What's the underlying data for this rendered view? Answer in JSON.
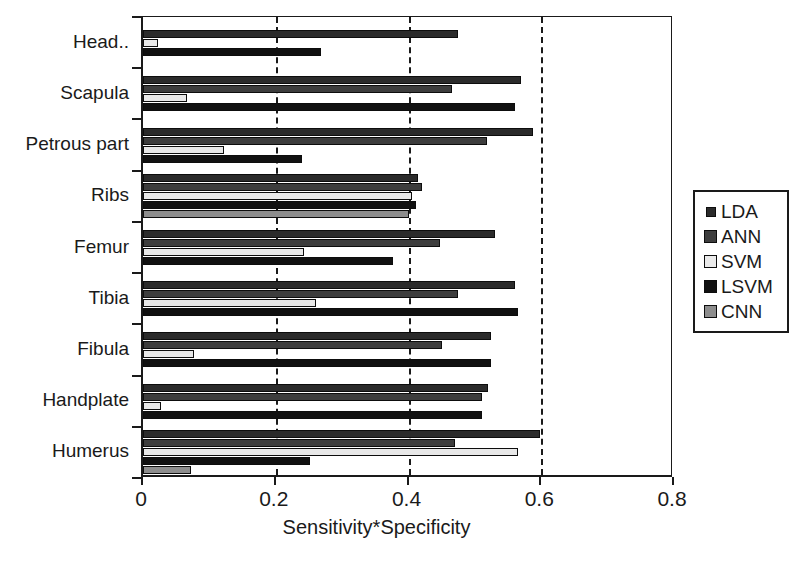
{
  "chart_data": {
    "type": "bar",
    "orientation": "horizontal",
    "title": "",
    "xlabel": "Sensitivity*Specificity",
    "ylabel": "",
    "xlim": [
      0,
      0.8
    ],
    "xticks": [
      "0",
      "0.2",
      "0.4",
      "0.6",
      "0.8"
    ],
    "xtick_values": [
      0,
      0.2,
      0.4,
      0.6,
      0.8
    ],
    "grid": "vertical-dashed-at-0.2-0.4-0.6",
    "legend_position": "right",
    "categories": [
      "Head..",
      "Scapula",
      "Petrous part",
      "Ribs",
      "Femur",
      "Tibia",
      "Fibula",
      "Handplate",
      "Humerus"
    ],
    "series": [
      {
        "name": "LDA",
        "color": "#2b2b2b",
        "values": [
          0.475,
          0.57,
          0.587,
          0.415,
          0.53,
          0.56,
          0.525,
          0.52,
          0.598
        ]
      },
      {
        "name": "ANN",
        "color": "#3d3d3d",
        "values": [
          0.0,
          0.466,
          0.519,
          0.42,
          0.447,
          0.474,
          0.45,
          0.51,
          0.47
        ]
      },
      {
        "name": "SVM",
        "color": "#e8e8e8",
        "values": [
          0.022,
          0.066,
          0.122,
          0.405,
          0.243,
          0.26,
          0.077,
          0.027,
          0.565
        ]
      },
      {
        "name": "LSVM",
        "color": "#111111",
        "values": [
          0.268,
          0.56,
          0.24,
          0.412,
          0.377,
          0.565,
          0.525,
          0.51,
          0.252
        ]
      },
      {
        "name": "CNN",
        "color": "#8d8d8d",
        "values": [
          0.0,
          0.0,
          0.0,
          0.4,
          0.0,
          0.0,
          0.0,
          0.0,
          0.072
        ]
      }
    ]
  },
  "legend": {
    "entries": [
      {
        "label": "LDA",
        "key": "LDA"
      },
      {
        "label": "ANN",
        "key": "ANN"
      },
      {
        "label": "SVM",
        "key": "SVM"
      },
      {
        "label": "LSVM",
        "key": "LSVM"
      },
      {
        "label": "CNN",
        "key": "CNN"
      }
    ]
  }
}
